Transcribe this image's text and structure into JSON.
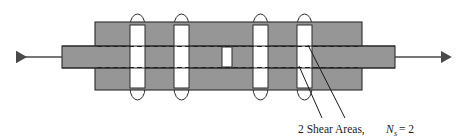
{
  "figure": {
    "kind": "engineering-diagram",
    "colors": {
      "plate_fill": "#969696",
      "plate_stroke": "#2b2b2b",
      "rivet_fill": "#ffffff",
      "rivet_stroke": "#2b2b2b",
      "dashed_line": "#1f1f1f",
      "arrow": "#4a4a4a",
      "leader": "#1a1a1a",
      "text": "#1a1a1a",
      "background": "#ffffff"
    }
  },
  "caption": {
    "prefix": "2 Shear Areas,",
    "symbol": "N",
    "subscript": "s",
    "equals": "= 2",
    "full_text": "2 Shear Areas,  N s = 2"
  },
  "load_arrows": {
    "left": {
      "name": "tension-load-left",
      "direction": "left"
    },
    "right": {
      "name": "tension-load-right",
      "direction": "right"
    }
  },
  "members": {
    "cover_plate": {
      "label": "cover plate",
      "x": 95,
      "y": 22,
      "width": 267,
      "height": 68
    },
    "main_plate": {
      "label": "main plate",
      "x": 62,
      "y": 46,
      "width": 333,
      "height": 22
    },
    "gap_block": {
      "label": "butt gap",
      "x": 222,
      "y": 47,
      "width": 10,
      "height": 20
    }
  },
  "rivets": [
    {
      "id": "rivet-1",
      "x": 130,
      "width": 15
    },
    {
      "id": "rivet-2",
      "x": 174,
      "width": 15
    },
    {
      "id": "rivet-3",
      "x": 253,
      "width": 15
    },
    {
      "id": "rivet-4",
      "x": 297,
      "width": 15
    }
  ],
  "shear_planes": {
    "count": 2,
    "callout_targets": [
      "upper-shear-plane",
      "lower-shear-plane"
    ]
  }
}
